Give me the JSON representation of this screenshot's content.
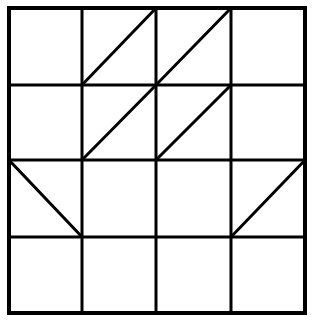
{
  "diagram": {
    "type": "grid-pattern",
    "rows": 4,
    "cols": 4,
    "stroke_color": "#000000",
    "background_color": "#ffffff",
    "bounds": {
      "x0": 9,
      "y0": 8,
      "x1": 305,
      "y1": 313
    },
    "col_lines": [
      9,
      82,
      156,
      231,
      305
    ],
    "row_lines": [
      8,
      85,
      160,
      237,
      313
    ],
    "diagonals": [
      {
        "row": 0,
        "col": 1,
        "direction": "/"
      },
      {
        "row": 0,
        "col": 2,
        "direction": "/"
      },
      {
        "row": 1,
        "col": 1,
        "direction": "/"
      },
      {
        "row": 1,
        "col": 2,
        "direction": "/"
      },
      {
        "row": 2,
        "col": 0,
        "direction": "\\"
      },
      {
        "row": 2,
        "col": 3,
        "direction": "/"
      }
    ]
  }
}
